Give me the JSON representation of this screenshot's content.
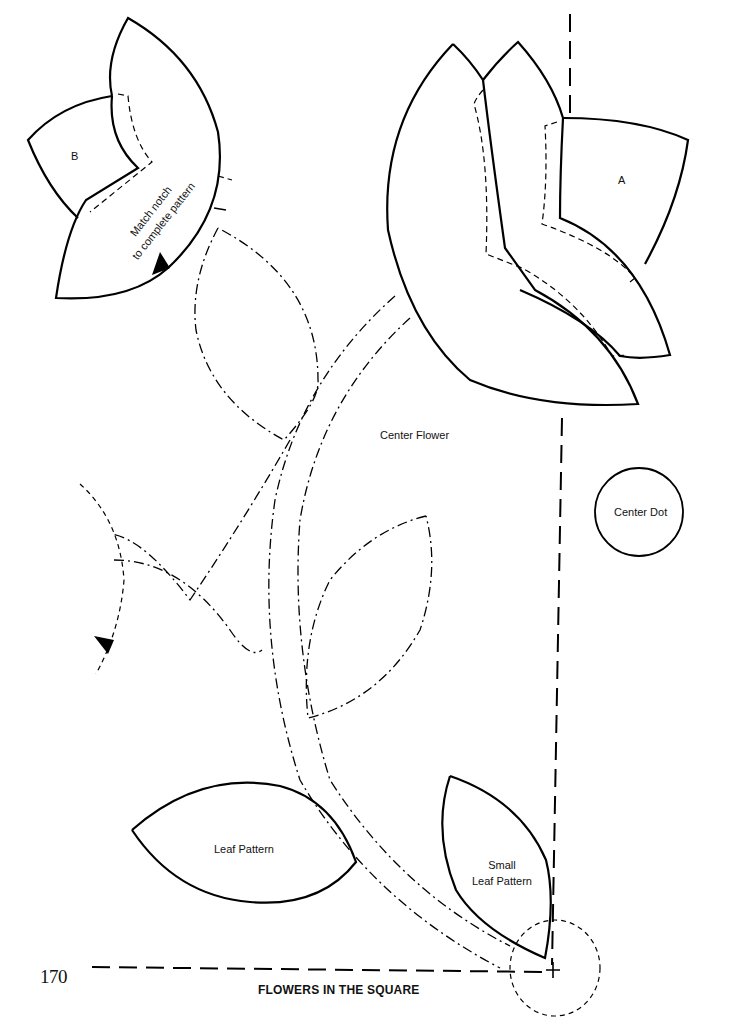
{
  "page": {
    "number": "170",
    "title": "FLOWERS IN THE SQUARE"
  },
  "labels": {
    "piece_b": "B",
    "piece_a": "A",
    "match_notch_line1": "Match notch",
    "match_notch_line2": "to complete pattern",
    "center_flower": "Center Flower",
    "center_dot": "Center Dot",
    "leaf_pattern": "Leaf Pattern",
    "small_leaf_line1": "Small",
    "small_leaf_line2": "Leaf Pattern"
  },
  "icons": {
    "notch_marker": "notch-triangle-icon",
    "registration_mark": "crosshair-plus-icon"
  },
  "colors": {
    "ink": "#000000",
    "paper": "#ffffff"
  }
}
